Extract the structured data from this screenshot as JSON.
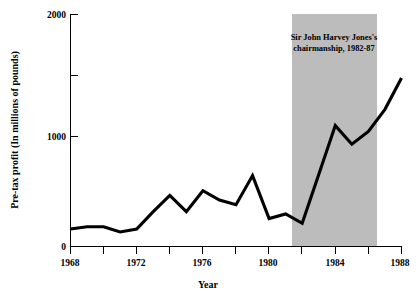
{
  "chart_data": {
    "type": "line",
    "title": "",
    "xlabel": "Year",
    "ylabel": "Pre-tax profit (In millions of pounds)",
    "xlim": [
      1968,
      1988
    ],
    "ylim": [
      0,
      2000
    ],
    "grid": false,
    "legend": null,
    "x": [
      1968,
      1969,
      1970,
      1971,
      1972,
      1973,
      1974,
      1975,
      1976,
      1977,
      1978,
      1979,
      1980,
      1981,
      1982,
      1983,
      1984,
      1985,
      1986,
      1987,
      1988
    ],
    "values": [
      150,
      170,
      170,
      125,
      150,
      300,
      440,
      300,
      480,
      400,
      360,
      610,
      240,
      280,
      200,
      620,
      1040,
      880,
      990,
      1180,
      1450
    ],
    "series": [
      {
        "name": "Pre-tax profit",
        "values": [
          150,
          170,
          170,
          125,
          150,
          300,
          440,
          300,
          480,
          400,
          360,
          610,
          240,
          280,
          200,
          620,
          1040,
          880,
          990,
          1180,
          1450
        ]
      }
    ],
    "x_ticks": [
      1968,
      1970,
      1972,
      1974,
      1976,
      1978,
      1980,
      1982,
      1984,
      1986,
      1988
    ],
    "x_tick_labels": [
      "1968",
      "",
      "1972",
      "",
      "1976",
      "",
      "1980",
      "",
      "1984",
      "",
      "1988"
    ],
    "y_ticks": [
      0,
      1000,
      1500,
      2000
    ],
    "y_tick_labels": [
      "0",
      "1000",
      "",
      "2000"
    ],
    "annotations": [
      {
        "name": "chairmanship-band",
        "text_line1": "Sir John Harvey Jones's",
        "text_line2": "chairmanship, 1982-87",
        "x_start": 1982,
        "x_end": 1987,
        "y_start": 0,
        "y_end": 2000,
        "color": "#b0b0b0"
      }
    ],
    "line_color": "#000000"
  },
  "axis": {
    "y_title": "Pre-tax profit (In millions of pounds)",
    "x_title": "Year",
    "y_label_2000": "2000",
    "y_label_1000": "1000",
    "y_label_0": "0",
    "x_label_1968": "1968",
    "x_label_1972": "1972",
    "x_label_1976": "1976",
    "x_label_1980": "1980",
    "x_label_1984": "1984",
    "x_label_1988": "1988"
  },
  "annotation": {
    "line1": "Sir John Harvey Jones's",
    "line2": "chairmanship, 1982-87"
  }
}
